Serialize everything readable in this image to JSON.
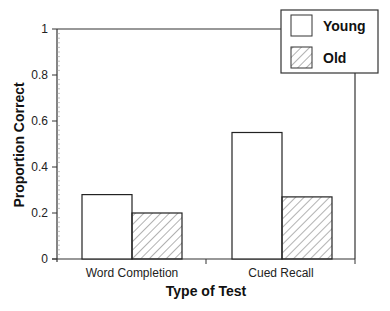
{
  "chart_data": {
    "type": "bar",
    "title": "",
    "xlabel": "Type of Test",
    "ylabel": "Proportion Correct",
    "categories": [
      "Word Completion",
      "Cued Recall"
    ],
    "series": [
      {
        "name": "Young",
        "values": [
          0.28,
          0.55
        ],
        "fill": "white"
      },
      {
        "name": "Old",
        "values": [
          0.2,
          0.27
        ],
        "fill": "diagonal-hatch"
      }
    ],
    "ylim": [
      0,
      1
    ],
    "yticks": [
      "0",
      "0.2",
      "0.4",
      "0.6",
      "0.8",
      "1"
    ],
    "grid": false,
    "legend_position": "upper right"
  },
  "colors": {
    "axis": "#333333",
    "bar_stroke": "#222222",
    "hatch": "#666666",
    "background": "#ffffff"
  }
}
